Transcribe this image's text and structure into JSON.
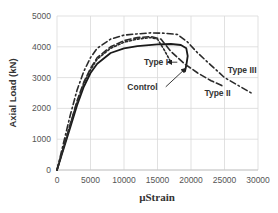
{
  "chart_data": {
    "type": "line",
    "title": "",
    "xlabel": "µStrain",
    "ylabel": "Axial Load (kN)",
    "xlim": [
      0,
      30000
    ],
    "ylim": [
      0,
      5000
    ],
    "xticks": [
      0,
      5000,
      10000,
      15000,
      20000,
      25000,
      30000
    ],
    "yticks": [
      0,
      1000,
      2000,
      3000,
      4000,
      5000
    ],
    "xtick_labels": [
      "0",
      "5000",
      "10000",
      "15000",
      "20000",
      "25000",
      "30000"
    ],
    "ytick_labels": [
      "0",
      "1000",
      "2000",
      "3000",
      "4000",
      "5000"
    ],
    "grid": true,
    "legend": "none (inline annotations)",
    "series": [
      {
        "name": "Control",
        "style": "solid",
        "x": [
          0,
          1000,
          2000,
          3000,
          4000,
          5000,
          6000,
          8000,
          10000,
          12000,
          15000,
          17000,
          18500,
          19300,
          19500,
          19300,
          19100
        ],
        "y": [
          0,
          700,
          1400,
          2100,
          2700,
          3150,
          3450,
          3800,
          3950,
          4020,
          4080,
          4090,
          4060,
          3950,
          3700,
          3400,
          3200
        ]
      },
      {
        "name": "Type I",
        "style": "short-dash",
        "x": [
          0,
          1000,
          2000,
          3000,
          4000,
          5000,
          6000,
          8000,
          10000,
          12000,
          14000,
          15000,
          16000,
          17000
        ],
        "y": [
          0,
          750,
          1500,
          2200,
          2800,
          3250,
          3600,
          3950,
          4150,
          4250,
          4300,
          4250,
          3900,
          3500
        ]
      },
      {
        "name": "Type II",
        "style": "long-dash",
        "x": [
          0,
          1000,
          2000,
          3000,
          4000,
          5000,
          6000,
          8000,
          10000,
          12000,
          14000,
          15500,
          17000,
          19000,
          21000,
          23000,
          25000
        ],
        "y": [
          0,
          750,
          1500,
          2250,
          2850,
          3300,
          3650,
          4000,
          4200,
          4300,
          4330,
          4250,
          3850,
          3450,
          3150,
          2900,
          2700
        ]
      },
      {
        "name": "Type III",
        "style": "dash-dot",
        "x": [
          0,
          1000,
          2000,
          3000,
          4000,
          5000,
          6000,
          8000,
          10000,
          12000,
          14000,
          16000,
          18000,
          19500,
          21000,
          23000,
          25000,
          27000,
          29000
        ],
        "y": [
          0,
          900,
          1800,
          2600,
          3200,
          3650,
          3950,
          4250,
          4380,
          4420,
          4450,
          4440,
          4400,
          4150,
          3800,
          3400,
          3000,
          2750,
          2500
        ]
      }
    ],
    "annotations": [
      {
        "text": "Type I",
        "x": 13000,
        "y": 3500,
        "arrow_to": [
          16500,
          3500
        ]
      },
      {
        "text": "Control",
        "x": 10500,
        "y": 2700,
        "arrow_to": [
          19200,
          3300
        ]
      },
      {
        "text": "Type II",
        "x": 22000,
        "y": 2500
      },
      {
        "text": "Type III",
        "x": 25500,
        "y": 3250
      }
    ]
  }
}
